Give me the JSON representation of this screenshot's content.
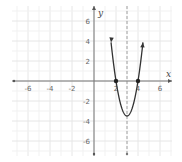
{
  "chart_data": {
    "type": "line",
    "title": "",
    "xlabel": "x",
    "ylabel": "y",
    "xlim": [
      -7.5,
      7.5
    ],
    "ylim": [
      -7,
      7
    ],
    "grid": true,
    "x_ticks": [
      -6,
      -4,
      -2,
      2,
      4,
      6
    ],
    "y_ticks": [
      -6,
      -4,
      -2,
      2,
      4,
      6
    ],
    "x_tick_labels": [
      "-6",
      "-4",
      "-2",
      "2",
      "4",
      "6"
    ],
    "y_tick_labels": [
      "-6",
      "-4",
      "-2",
      "2",
      "4",
      "6"
    ],
    "series": [
      {
        "name": "parabola",
        "equation": "y = 3.5(x-2)(x-4)",
        "x": [
          1.55,
          2,
          2.5,
          3,
          3.5,
          4,
          4.45
        ],
        "y": [
          6.6,
          0,
          -2.625,
          -3.5,
          -2.625,
          0,
          6.6
        ],
        "color": "#333333",
        "arrows_at_ends": true
      }
    ],
    "points": [
      {
        "x": 2,
        "y": 0,
        "label": "x-intercept"
      },
      {
        "x": 4,
        "y": 0,
        "label": "x-intercept"
      }
    ],
    "vertex": {
      "x": 3,
      "y": -3.5
    },
    "axis_of_symmetry": {
      "x": 3,
      "style": "dashed"
    }
  }
}
